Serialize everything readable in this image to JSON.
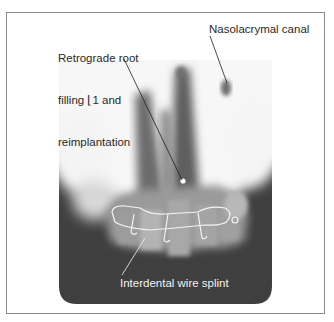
{
  "figure": {
    "labels": {
      "retrograde": {
        "line1": "Retrograde root",
        "line2": "filling ⌊1 and",
        "line3": "reimplantation"
      },
      "nasolacrymal": "Nasolacrymal canal",
      "splint": "Interdental wire splint"
    },
    "colors": {
      "frame_border": "#8a8a8a",
      "xray_dark": "#3e3e3e",
      "xray_light": "#f5f5f5",
      "label_dark": "#2a2a2a",
      "label_light": "#f2f2f2"
    }
  }
}
